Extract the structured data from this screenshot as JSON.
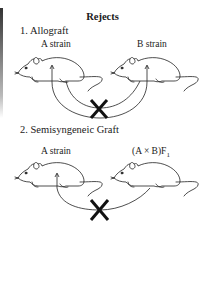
{
  "title": "Rejects",
  "sections": [
    {
      "heading": "1. Allograft",
      "donor_label": "A strain",
      "recipient_label": "B strain",
      "rejection_mark": "X",
      "grafts": [
        "A to B",
        "B to A"
      ]
    },
    {
      "heading": "2. Semisyngeneic Graft",
      "donor_label": "A strain",
      "recipient_label": "(A × B)F",
      "recipient_label_subscript": "1",
      "rejection_mark": "X",
      "grafts": [
        "F1 to A"
      ]
    }
  ],
  "colors": {
    "line": "#222222",
    "background": "#ffffff"
  }
}
